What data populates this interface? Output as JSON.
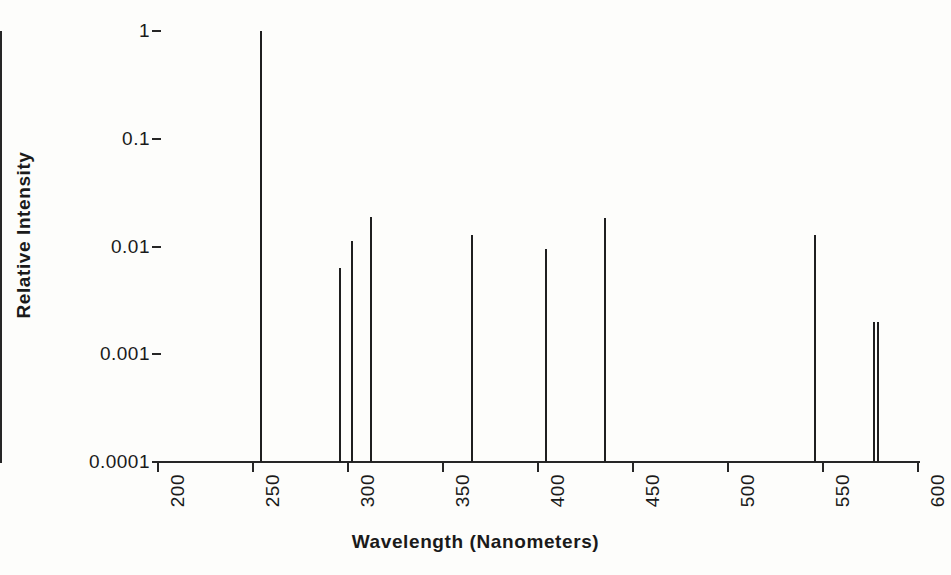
{
  "chart_data": {
    "type": "line",
    "title": "",
    "xlabel": "Wavelength (Nanometers)",
    "ylabel": "Relative Intensity",
    "xlim": [
      200,
      600
    ],
    "ylim": [
      0.0001,
      1
    ],
    "yscale": "log",
    "xticks": [
      200,
      250,
      300,
      350,
      400,
      450,
      500,
      550,
      600
    ],
    "xtick_labels": [
      "200",
      "250",
      "300",
      "350",
      "400",
      "450",
      "500",
      "550",
      "600"
    ],
    "yticks": [
      1,
      0.1,
      0.01,
      0.001,
      0.0001
    ],
    "ytick_labels": [
      "1",
      "0.1",
      "0.01",
      "0.001",
      "0.0001"
    ],
    "grid": false,
    "legend": "none",
    "x": [
      254,
      296,
      302,
      312,
      365,
      404,
      435,
      546,
      577,
      579
    ],
    "values": [
      1.0,
      0.0063,
      0.0113,
      0.0188,
      0.0128,
      0.0094,
      0.0183,
      0.0128,
      0.002,
      0.002
    ],
    "series": [
      {
        "name": "Emission spectrum",
        "points": [
          {
            "wavelength": 254,
            "intensity": 1.0
          },
          {
            "wavelength": 296,
            "intensity": 0.0063
          },
          {
            "wavelength": 302,
            "intensity": 0.0113
          },
          {
            "wavelength": 312,
            "intensity": 0.0188
          },
          {
            "wavelength": 365,
            "intensity": 0.0128
          },
          {
            "wavelength": 404,
            "intensity": 0.0094
          },
          {
            "wavelength": 435,
            "intensity": 0.0183
          },
          {
            "wavelength": 546,
            "intensity": 0.0128
          },
          {
            "wavelength": 577,
            "intensity": 0.002
          },
          {
            "wavelength": 579,
            "intensity": 0.002
          }
        ]
      }
    ]
  },
  "axes": {
    "x_title": "Wavelength (Nanometers)",
    "y_title": "Relative Intensity"
  },
  "colors": {
    "line": "#1f1f1f",
    "axis": "#262626",
    "text": "#1a1a1a",
    "background": "#fdfdfb"
  }
}
